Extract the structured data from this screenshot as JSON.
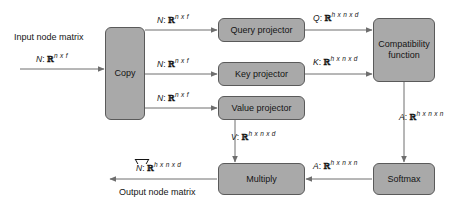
{
  "diagram": {
    "background_color": "#ffffff",
    "box_fill_color": "#a9a9a9",
    "box_border_color": "#5a5a5a",
    "arrow_color": "#6e6e6e",
    "text_color": "#141414"
  },
  "nodes": {
    "copy": "Copy",
    "query_projector": "Query projector",
    "key_projector": "Key projector",
    "value_projector": "Value projector",
    "compatibility_function_line1": "Compatibility",
    "compatibility_function_line2": "function",
    "softmax": "Softmax",
    "multiply": "Multiply"
  },
  "labels": {
    "input_title": "Input node matrix",
    "output_title": "Output node matrix",
    "input_matrix": {
      "symbol": "N",
      "colon": ":",
      "set": "ℝ",
      "exponent": "n x f"
    },
    "copy_out_1": {
      "symbol": "N",
      "colon": ":",
      "set": "ℝ",
      "exponent": "n x f"
    },
    "copy_out_2": {
      "symbol": "N",
      "colon": ":",
      "set": "ℝ",
      "exponent": "n x f"
    },
    "copy_out_3": {
      "symbol": "N",
      "colon": ":",
      "set": "ℝ",
      "exponent": "n x f"
    },
    "query_out": {
      "symbol": "Q",
      "colon": ":",
      "set": "ℝ",
      "exponent": "h x n x d"
    },
    "key_out": {
      "symbol": "K",
      "colon": ":",
      "set": "ℝ",
      "exponent": "h x n x d"
    },
    "value_out": {
      "symbol": "V",
      "colon": ":",
      "set": "ℝ",
      "exponent": "h x n x d"
    },
    "compat_out": {
      "symbol": "A",
      "colon": ":",
      "set": "ℝ",
      "exponent": "h x n x n"
    },
    "softmax_out": {
      "symbol": "A",
      "colon": ":",
      "set": "ℝ",
      "exponent": "h x n x n"
    },
    "output_matrix": {
      "symbol": "N",
      "colon": ":",
      "set": "ℝ",
      "exponent": "h x n x d"
    }
  }
}
